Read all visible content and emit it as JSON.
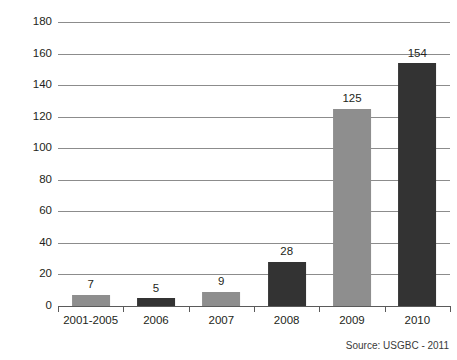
{
  "chart_data": {
    "type": "bar",
    "title": "",
    "subtitle": "",
    "xlabel": "",
    "ylabel": "Millions square feet",
    "categories": [
      "2001-2005",
      "2006",
      "2007",
      "2008",
      "2009",
      "2010"
    ],
    "values": [
      7,
      5,
      9,
      28,
      125,
      154
    ],
    "value_labels": [
      "7",
      "5",
      "9",
      "28",
      "125",
      "154"
    ],
    "bar_colors": [
      "#8e8e8e",
      "#333333",
      "#8e8e8e",
      "#333333",
      "#8e8e8e",
      "#333333"
    ],
    "ylim": [
      0,
      180
    ],
    "ytick_step": 20,
    "ytick_labels": [
      "180",
      "160",
      "140",
      "120",
      "100",
      "80",
      "60",
      "40",
      "20",
      "0"
    ],
    "ytick_values": [
      180,
      160,
      140,
      120,
      100,
      80,
      60,
      40,
      20,
      0
    ],
    "grid": true,
    "grid_axis": "y",
    "legend": false,
    "legend_position": "none"
  },
  "annotations": {
    "source": "Source: USGBC - 2011"
  },
  "colors": {
    "bar_light": "#8e8e8e",
    "bar_dark": "#333333",
    "gridline": "#8c8c8c",
    "axis": "#5a5a5a",
    "text": "#231f20",
    "background": "#ffffff"
  }
}
